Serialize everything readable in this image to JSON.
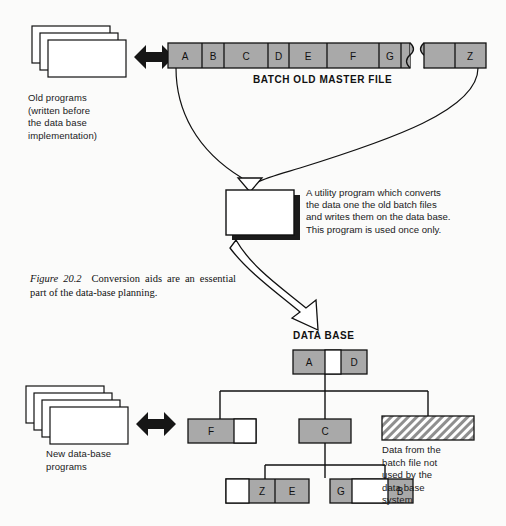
{
  "figure": {
    "caption_title": "Figure 20.2",
    "caption_body": "Conversion aids are an essential part of the data-base planning."
  },
  "colors": {
    "cell_fill": "#a9a9a9",
    "cell_empty": "#ffffff",
    "stroke": "#111111",
    "hatch": "#a9a9a9",
    "background": "#fbfbfa"
  },
  "old_programs": {
    "label": "Old programs\n(written before\nthe data base\nimplementation)",
    "label_lines": [
      "Old programs",
      "(written before",
      "the data base",
      "implementation)"
    ],
    "card_count": 3
  },
  "new_programs": {
    "label_lines": [
      "New data-base",
      "programs"
    ],
    "card_count": 4
  },
  "batch_file": {
    "title": "BATCH OLD MASTER FILE",
    "segments_main": [
      {
        "label": "A",
        "width": 34,
        "filled": true
      },
      {
        "label": "B",
        "width": 22,
        "filled": true
      },
      {
        "label": "C",
        "width": 44,
        "filled": true
      },
      {
        "label": "D",
        "width": 21,
        "filled": true
      },
      {
        "label": "E",
        "width": 38,
        "filled": true
      },
      {
        "label": "F",
        "width": 52,
        "filled": true
      },
      {
        "label": "G",
        "width": 22,
        "filled": true
      },
      {
        "label": "",
        "width": 9,
        "filled": true
      }
    ],
    "segments_tail": [
      {
        "label": "",
        "width": 36,
        "filled": true
      },
      {
        "label": "Z",
        "width": 36,
        "filled": true
      }
    ],
    "break_marker": "tape-break"
  },
  "utility_program": {
    "text_lines": [
      "A utility program which converts",
      "the data one the old batch files",
      "and writes them on the data base.",
      "This program is used once only."
    ]
  },
  "data_base": {
    "title": "DATA BASE",
    "root": {
      "name": "root-record",
      "cells": [
        {
          "label": "A",
          "width": 32,
          "filled": true
        },
        {
          "label": "",
          "width": 16,
          "filled": false
        },
        {
          "label": "D",
          "width": 26,
          "filled": true
        }
      ]
    },
    "children": [
      {
        "name": "record-f",
        "cells": [
          {
            "label": "F",
            "width": 46,
            "filled": true
          },
          {
            "label": "",
            "width": 22,
            "filled": false
          }
        ]
      },
      {
        "name": "record-c",
        "cells": [
          {
            "label": "C",
            "width": 52,
            "filled": true
          }
        ]
      },
      {
        "name": "record-unused",
        "hatched": true,
        "cells": [
          {
            "label": "",
            "width": 92,
            "filled": true
          }
        ]
      }
    ],
    "grandchildren": [
      {
        "name": "record-ze",
        "cells": [
          {
            "label": "",
            "width": 23,
            "filled": false
          },
          {
            "label": "Z",
            "width": 26,
            "filled": true
          },
          {
            "label": "E",
            "width": 34,
            "filled": true
          }
        ]
      },
      {
        "name": "record-gb",
        "cells": [
          {
            "label": "G",
            "width": 22,
            "filled": true
          },
          {
            "label": "",
            "width": 36,
            "filled": false
          },
          {
            "label": "B",
            "width": 25,
            "filled": true
          }
        ]
      }
    ],
    "unused_note_lines": [
      "Data from the",
      "batch file not",
      "used by the",
      "data base",
      "system"
    ]
  },
  "arrows": {
    "top_bidirectional": "double-headed-arrow",
    "bottom_bidirectional": "double-headed-arrow",
    "funnel_to_utility": "hollow-arrow-down",
    "utility_to_database": "curved-hollow-arrow"
  }
}
